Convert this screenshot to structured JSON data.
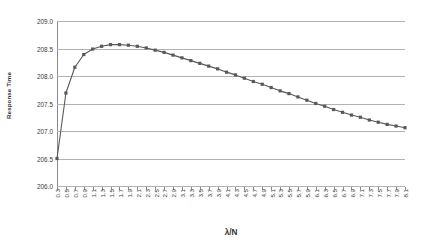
{
  "chart_data": {
    "type": "line",
    "title": "",
    "subtitle": "",
    "xlabel": "λ/N",
    "ylabel": "Response Time",
    "grid": true,
    "legend": "none",
    "marker": "square",
    "series_color": "#595959",
    "gridline_color": "#b3b3b3",
    "background_color": "#ffffff",
    "xlim": [
      0.3,
      8.1
    ],
    "ylim": [
      206.0,
      209.0
    ],
    "ytick_step": 0.5,
    "xtick_step": 0.2,
    "ytick_labels": [
      "209.0",
      "208.5",
      "208.0",
      "207.5",
      "207.0",
      "206.5",
      "206.0"
    ],
    "ytick_values": [
      209.0,
      208.5,
      208.0,
      207.5,
      207.0,
      206.5,
      206.0
    ],
    "categories": [
      "0.3",
      "0.5",
      "0.7",
      "0.9",
      "1.1",
      "1.3",
      "1.5",
      "1.7",
      "1.9",
      "2.1",
      "2.3",
      "2.5",
      "2.7",
      "2.9",
      "3.1",
      "3.3",
      "3.5",
      "3.7",
      "3.9",
      "4.1",
      "4.3",
      "4.5",
      "4.7",
      "4.9",
      "5.1",
      "5.3",
      "5.5",
      "5.7",
      "5.9",
      "6.1",
      "6.3",
      "6.5",
      "6.7",
      "6.9",
      "7.1",
      "7.3",
      "7.5",
      "7.7",
      "7.9",
      "8.1"
    ],
    "x": [
      0.3,
      0.5,
      0.7,
      0.9,
      1.1,
      1.3,
      1.5,
      1.7,
      1.9,
      2.1,
      2.3,
      2.5,
      2.7,
      2.9,
      3.1,
      3.3,
      3.5,
      3.7,
      3.9,
      4.1,
      4.3,
      4.5,
      4.7,
      4.9,
      5.1,
      5.3,
      5.5,
      5.7,
      5.9,
      6.1,
      6.3,
      6.5,
      6.7,
      6.9,
      7.1,
      7.3,
      7.5,
      7.7,
      7.9,
      8.1
    ],
    "values": [
      206.5,
      207.69,
      208.16,
      208.39,
      208.49,
      208.54,
      208.57,
      208.57,
      208.56,
      208.54,
      208.51,
      208.47,
      208.43,
      208.38,
      208.33,
      208.28,
      208.23,
      208.18,
      208.13,
      208.07,
      208.02,
      207.96,
      207.9,
      207.85,
      207.79,
      207.73,
      207.68,
      207.62,
      207.56,
      207.5,
      207.45,
      207.39,
      207.34,
      207.29,
      207.25,
      207.2,
      207.16,
      207.12,
      207.09,
      207.06
    ],
    "series": [
      {
        "name": "Response Time",
        "values": [
          206.5,
          207.69,
          208.16,
          208.39,
          208.49,
          208.54,
          208.57,
          208.57,
          208.56,
          208.54,
          208.51,
          208.47,
          208.43,
          208.38,
          208.33,
          208.28,
          208.23,
          208.18,
          208.13,
          208.07,
          208.02,
          207.96,
          207.9,
          207.85,
          207.79,
          207.73,
          207.68,
          207.62,
          207.56,
          207.5,
          207.45,
          207.39,
          207.34,
          207.29,
          207.25,
          207.2,
          207.16,
          207.12,
          207.09,
          207.06
        ]
      }
    ],
    "annotations": []
  }
}
